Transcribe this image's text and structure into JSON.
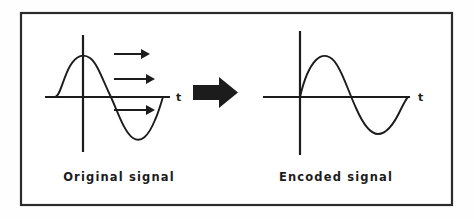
{
  "figure": {
    "background_color": "#ffffff",
    "frame": {
      "border_color": "#2b2b2b",
      "x": 21,
      "y": 13,
      "width": 431,
      "height": 192
    },
    "ink_color": "#1c1c1c"
  },
  "panels": [
    {
      "id": "original",
      "caption": "Original signal",
      "caption_x": 119,
      "caption_y": 181,
      "axis": {
        "x_axis_label": "t",
        "x_label_x": 176,
        "x_label_y": 101,
        "x_axis_y": 97,
        "x_axis_from": 45,
        "x_axis_to": 170,
        "y_axis_x": 83,
        "y_axis_from": 35,
        "y_axis_to": 152
      },
      "wave": {
        "type": "sine",
        "phase_shifted": true,
        "start_x": 55,
        "end_x": 163,
        "amplitude": 42,
        "description": "one full sine cycle, positive hump left of y-axis peak, crossing zero left of origin"
      }
    },
    {
      "id": "encoded",
      "caption": "Encoded signal",
      "caption_x": 336,
      "caption_y": 181,
      "axis": {
        "x_axis_label": "t",
        "x_label_x": 418,
        "x_label_y": 101,
        "x_axis_y": 97,
        "x_axis_from": 263,
        "x_axis_to": 410,
        "y_axis_x": 300,
        "y_axis_from": 31,
        "y_axis_to": 155
      },
      "wave": {
        "type": "sine",
        "phase_shifted": false,
        "start_x": 300,
        "end_x": 408,
        "amplitude": 42,
        "description": "one full sine cycle beginning exactly at the origin"
      }
    }
  ],
  "small_arrows": [
    {
      "name": "propagation-arrow-top",
      "x1": 114,
      "x2": 147,
      "y": 54
    },
    {
      "name": "propagation-arrow-middle",
      "x1": 114,
      "x2": 152,
      "y": 79
    },
    {
      "name": "propagation-arrow-bottom",
      "x1": 114,
      "x2": 152,
      "y": 110
    }
  ],
  "big_arrow": {
    "name": "transform-arrow",
    "label": "encodes to",
    "x": 193,
    "y": 92,
    "width": 45,
    "height": 30
  }
}
